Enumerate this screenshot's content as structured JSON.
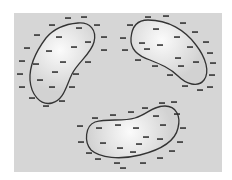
{
  "diagram": {
    "type": "charged-conductors",
    "panel": {
      "x": 14,
      "y": 13,
      "width": 208,
      "height": 159,
      "color": "#d8d8d8"
    },
    "colors": {
      "background": "#ffffff",
      "panel": "#d6d6d6",
      "blob_fill_center": "#fbfbfb",
      "blob_fill_edge": "#d2d2d2",
      "outline": "#333333",
      "charge": "#2a2a2a"
    },
    "charge_symbol": "−",
    "blobs": [
      {
        "name": "left-blob",
        "path": "M78,23 C90,22 97,30 94,42 C91,54 78,62 72,74 C66,86 64,100 52,103 C40,106 31,94 30,80 C29,64 37,50 46,38 C55,27 66,24 78,23 Z",
        "gradient_center": [
          60,
          50
        ],
        "outside_charges": [
          [
            68,
            18
          ],
          [
            84,
            17
          ],
          [
            52,
            25
          ],
          [
            97,
            25
          ],
          [
            37,
            35
          ],
          [
            104,
            37
          ],
          [
            27,
            48
          ],
          [
            104,
            50
          ],
          [
            22,
            61
          ],
          [
            88,
            62
          ],
          [
            20,
            74
          ],
          [
            76,
            74
          ],
          [
            22,
            87
          ],
          [
            72,
            87
          ],
          [
            32,
            98
          ],
          [
            62,
            101
          ],
          [
            46,
            106
          ]
        ],
        "inside_charges": [
          [
            79,
            28
          ],
          [
            59,
            37
          ],
          [
            49,
            51
          ],
          [
            74,
            47
          ],
          [
            88,
            42
          ],
          [
            63,
            62
          ],
          [
            36,
            64
          ],
          [
            55,
            72
          ],
          [
            52,
            87
          ],
          [
            40,
            80
          ]
        ]
      },
      {
        "name": "right-blob",
        "path": "M148,20 C168,20 185,30 196,45 C206,58 210,72 204,80 C198,88 186,84 178,76 C170,68 160,64 150,60 C138,56 130,50 131,38 C132,26 138,20 148,20 Z",
        "gradient_center": [
          162,
          40
        ],
        "outside_charges": [
          [
            148,
            17
          ],
          [
            166,
            16
          ],
          [
            130,
            25
          ],
          [
            183,
            23
          ],
          [
            123,
            38
          ],
          [
            195,
            32
          ],
          [
            125,
            50
          ],
          [
            206,
            42
          ],
          [
            138,
            60
          ],
          [
            210,
            53
          ],
          [
            155,
            66
          ],
          [
            213,
            63
          ],
          [
            170,
            75
          ],
          [
            212,
            75
          ],
          [
            185,
            86
          ],
          [
            210,
            87
          ],
          [
            200,
            90
          ]
        ],
        "inside_charges": [
          [
            156,
            29
          ],
          [
            142,
            43
          ],
          [
            160,
            45
          ],
          [
            177,
            37
          ],
          [
            190,
            47
          ],
          [
            178,
            58
          ],
          [
            196,
            62
          ],
          [
            181,
            66
          ],
          [
            147,
            49
          ]
        ]
      },
      {
        "name": "bottom-blob",
        "path": "M95,122 C108,118 122,122 135,118 C148,114 152,106 165,106 C176,106 181,116 178,128 C175,142 160,150 140,155 C120,160 100,158 91,150 C84,142 85,126 95,122 Z",
        "gradient_center": [
          130,
          132
        ],
        "outside_charges": [
          [
            95,
            118
          ],
          [
            113,
            115
          ],
          [
            131,
            112
          ],
          [
            145,
            108
          ],
          [
            162,
            103
          ],
          [
            174,
            102
          ],
          [
            177,
            114
          ],
          [
            80,
            126
          ],
          [
            183,
            128
          ],
          [
            81,
            142
          ],
          [
            180,
            142
          ],
          [
            89,
            153
          ],
          [
            172,
            151
          ],
          [
            98,
            159
          ],
          [
            160,
            158
          ],
          [
            117,
            163
          ],
          [
            143,
            163
          ],
          [
            123,
            168
          ]
        ],
        "inside_charges": [
          [
            99,
            128
          ],
          [
            118,
            125
          ],
          [
            136,
            128
          ],
          [
            156,
            116
          ],
          [
            163,
            125
          ],
          [
            146,
            137
          ],
          [
            103,
            143
          ],
          [
            120,
            148
          ],
          [
            139,
            144
          ],
          [
            160,
            139
          ],
          [
            133,
            152
          ]
        ]
      }
    ]
  }
}
